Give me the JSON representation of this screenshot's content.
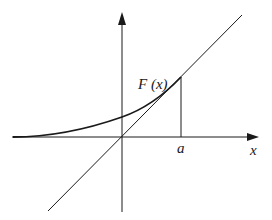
{
  "diagram": {
    "labels": {
      "curve": "F (x)",
      "point_a": "a",
      "x_axis": "x"
    },
    "colors": {
      "stroke": "#1a1a1a",
      "background": "#ffffff"
    },
    "elements": [
      "x-axis with arrow",
      "y-axis with arrow",
      "diagonal line y = x through origin",
      "convex curve F(x) tangent to the line at x = a, asymptotic to x-axis on the left",
      "vertical segment from (a, 0) to (a, F(a))"
    ]
  }
}
